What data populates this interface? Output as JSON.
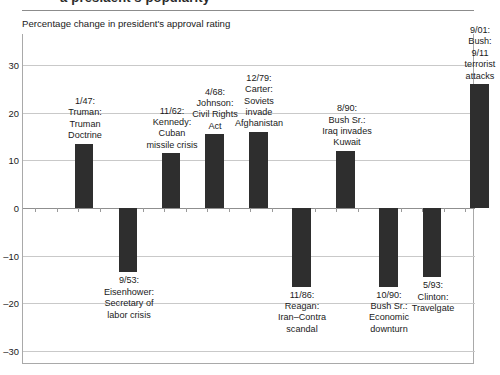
{
  "page_bleed_text": "a presiaent's popularity",
  "caption": "Percentage change in president's approval rating",
  "axis": {
    "yticks": [
      "30",
      "20",
      "10",
      "0",
      "–10",
      "–20",
      "–30"
    ],
    "ymin": -30,
    "ymax": 30
  },
  "chart_data": {
    "type": "bar",
    "title": "",
    "subtitle": "Percentage change in president's approval rating",
    "xlabel": "",
    "ylabel": "",
    "ylim": [
      -30,
      30
    ],
    "grid": true,
    "legend": "none",
    "categories": [
      "1/47: Truman: Truman Doctrine",
      "9/53: Eisenhower: Secretary of labor crisis",
      "11/62: Kennedy: Cuban missile crisis",
      "4/68: Johnson: Civil Rights Act",
      "12/79: Carter: Soviets invade Afghanistan",
      "11/86: Reagan: Iran–Contra scandal",
      "8/90: Bush Sr.: Iraq invades Kuwait",
      "10/90: Bush Sr.: Economic downturn",
      "5/93: Clinton: Travelgate",
      "9/01: Bush: 9/11 terrorist attacks"
    ],
    "values": [
      13.5,
      -13.5,
      11.5,
      15.5,
      16,
      -16.5,
      12,
      -16.5,
      -14.5,
      26
    ],
    "bars": [
      {
        "label_lines": [
          "1/47:",
          "Truman:",
          "Truman",
          "Doctrine"
        ],
        "value": 13.5,
        "sign": "positive",
        "x": 52,
        "width": 18,
        "label_x": 20,
        "label_w": 84
      },
      {
        "label_lines": [
          "9/53:",
          "Eisenhower:",
          "Secretary of",
          "labor crisis"
        ],
        "value": -13.5,
        "sign": "negative",
        "x": 96,
        "width": 18,
        "label_x": 60,
        "label_w": 92
      },
      {
        "label_lines": [
          "11/62:",
          "Kennedy:",
          "Cuban",
          "missile crisis"
        ],
        "value": 11.5,
        "sign": "positive",
        "x": 139,
        "width": 18,
        "label_x": 104,
        "label_w": 90
      },
      {
        "label_lines": [
          "4/68:",
          "Johnson:",
          "Civil Rights",
          "Act"
        ],
        "value": 15.5,
        "sign": "positive",
        "x": 182,
        "width": 19,
        "label_x": 152,
        "label_w": 80
      },
      {
        "label_lines": [
          "12/79:",
          "Carter:",
          "Soviets",
          "invade",
          "Afghanistan"
        ],
        "value": 16,
        "sign": "positive",
        "x": 226,
        "width": 19,
        "label_x": 192,
        "label_w": 88
      },
      {
        "label_lines": [
          "11/86:",
          "Reagan:",
          "Iran–Contra",
          "scandal"
        ],
        "value": -16.5,
        "sign": "negative",
        "x": 269,
        "width": 19,
        "label_x": 236,
        "label_w": 86
      },
      {
        "label_lines": [
          "8/90:",
          "Bush Sr.:",
          "Iraq invades",
          "Kuwait"
        ],
        "value": 12,
        "sign": "positive",
        "x": 313,
        "width": 19,
        "label_x": 284,
        "label_w": 80
      },
      {
        "label_lines": [
          "10/90:",
          "Bush Sr.:",
          "Economic",
          "downturn"
        ],
        "value": -16.5,
        "sign": "negative",
        "x": 356,
        "width": 19,
        "label_x": 326,
        "label_w": 80
      },
      {
        "label_lines": [
          "5/93:",
          "Clinton:",
          "Travelgate"
        ],
        "value": -14.5,
        "sign": "negative",
        "x": 400,
        "width": 18,
        "label_x": 371,
        "label_w": 78
      },
      {
        "label_lines": [
          "9/01:",
          "Bush:",
          "9/11",
          "terrorist",
          "attacks"
        ],
        "value": 26,
        "sign": "positive",
        "x": 447,
        "width": 19,
        "label_x": 420,
        "label_w": 74
      }
    ]
  },
  "colors": {
    "bar": "#2e2e2e",
    "gridline": "#c9c9c9",
    "axis": "#8f8f8f",
    "text": "#1a1a1a",
    "background": "#ffffff"
  }
}
